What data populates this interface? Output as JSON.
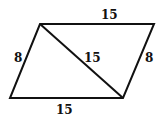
{
  "diagram": {
    "shape": "parallelogram",
    "vertices": {
      "top_left": [
        40,
        24
      ],
      "top_right": [
        154,
        24
      ],
      "bottom_right": [
        123,
        98
      ],
      "bottom_left": [
        10,
        98
      ]
    },
    "diagonal": {
      "from": "top_left",
      "to": "bottom_right"
    },
    "labels": {
      "top": "15",
      "bottom": "15",
      "left": "8",
      "right": "8",
      "diagonal": "15"
    },
    "stroke_color": "#111111"
  }
}
